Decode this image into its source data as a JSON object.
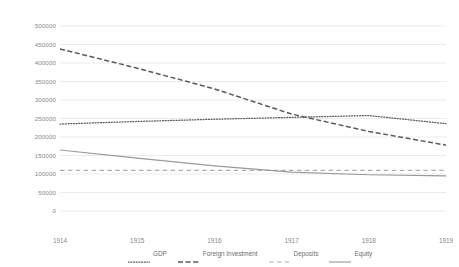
{
  "chart_data": {
    "type": "line",
    "title": "",
    "subtitle": "",
    "xlabel": "",
    "ylabel": "",
    "categories": [
      "1914",
      "1915",
      "1916",
      "1917",
      "1918",
      "1919"
    ],
    "x": [
      1914,
      1915,
      1916,
      1917,
      1918,
      1919
    ],
    "xlim": [
      1914,
      1919
    ],
    "ylim": [
      0,
      500000
    ],
    "yticks": [
      0,
      50000,
      100000,
      150000,
      200000,
      250000,
      300000,
      350000,
      400000,
      450000,
      500000
    ],
    "ytick_labels": [
      "0",
      "50000",
      "100000",
      "150000",
      "200000",
      "250000",
      "300000",
      "350000",
      "400000",
      "450000",
      "500000"
    ],
    "grid": true,
    "grid_axis": "y",
    "legend_position": "bottom",
    "series": [
      {
        "name": "GDP",
        "style": "dotted",
        "color": "#5a5a5a",
        "values": [
          235000,
          242000,
          248000,
          253000,
          258000,
          236000
        ]
      },
      {
        "name": "Foreign Investment",
        "style": "dashed",
        "color": "#5a5a5a",
        "values": [
          438000,
          386000,
          330000,
          262000,
          215000,
          178000
        ]
      },
      {
        "name": "Deposits",
        "style": "long-dash",
        "color": "#b0b0b0",
        "values": [
          110000,
          110000,
          110000,
          110000,
          110000,
          110000
        ]
      },
      {
        "name": "Equity",
        "style": "solid",
        "color": "#9a9a9a",
        "values": [
          165000,
          143000,
          122000,
          105000,
          98000,
          95000
        ]
      }
    ]
  },
  "legend": {
    "items": [
      {
        "label": "GDP",
        "icon": "dotted-line-icon"
      },
      {
        "label": "Foreign Investment",
        "icon": "dashed-line-icon"
      },
      {
        "label": "Deposits",
        "icon": "long-dash-line-icon"
      },
      {
        "label": "Equity",
        "icon": "solid-line-icon"
      }
    ]
  }
}
